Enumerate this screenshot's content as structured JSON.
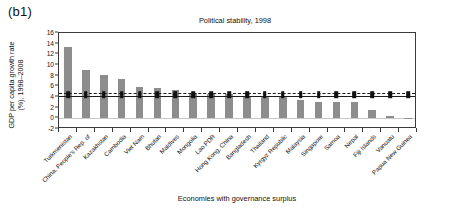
{
  "panel": {
    "label": "(b1)"
  },
  "chart_data": {
    "type": "bar",
    "title": "Political stability, 1998",
    "xlabel": "Economies with governance surplus",
    "ylabel": "GDP per capita growth rate (%), 1998–2008",
    "ylabel_line1": "GDP per capita growth rate",
    "ylabel_line2": "(%), 1998–2008",
    "ylim": [
      -2,
      16
    ],
    "ytick_labels": [
      "16",
      "14",
      "12",
      "10",
      "8",
      "6",
      "4",
      "2",
      "0",
      "-2"
    ],
    "yticks": [
      16,
      14,
      12,
      10,
      8,
      6,
      4,
      2,
      0,
      -2
    ],
    "grid": false,
    "legend_position": "none",
    "bar_color": "#8d8d8d",
    "line_color": "#1d1d1d",
    "categories": [
      "Turkmenistan",
      "China, People's Rep. of",
      "Kazakhstan",
      "Cambodia",
      "Viet Nam",
      "Bhutan",
      "Maldives",
      "Mongolia",
      "Lao PDR",
      "Hong Kong, China",
      "Bangladesh",
      "Thailand",
      "Kyrgyz Republic",
      "Malaysia",
      "Singapore",
      "Samoa",
      "Nepal",
      "Fiji Islands",
      "Vanuatu",
      "Papua New Guinea"
    ],
    "values": [
      13.4,
      9.0,
      8.2,
      7.3,
      5.8,
      5.7,
      5.3,
      4.7,
      4.6,
      4.5,
      4.1,
      4.0,
      4.0,
      3.5,
      3.1,
      3.0,
      3.0,
      1.5,
      0.5,
      0.05
    ],
    "series": [
      {
        "name": "GDP per capita growth rate (%), 1998–2008",
        "type": "bar",
        "values": [
          13.4,
          9.0,
          8.2,
          7.3,
          5.8,
          5.7,
          5.3,
          4.7,
          4.6,
          4.5,
          4.1,
          4.0,
          4.0,
          3.5,
          3.1,
          3.0,
          3.0,
          1.5,
          0.5,
          0.05
        ]
      },
      {
        "name": "reference line (dashed)",
        "type": "line",
        "style": "dashed",
        "value": 4.7,
        "markers": true
      },
      {
        "name": "reference line (solid)",
        "type": "line",
        "style": "solid",
        "value": 4.2,
        "markers": true
      }
    ],
    "reference_dashed": 4.7,
    "reference_solid": 4.2,
    "zero_line": 0
  }
}
